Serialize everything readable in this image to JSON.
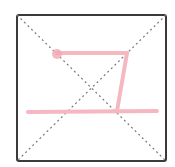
{
  "grid": {
    "box": {
      "x": 17,
      "y": 15,
      "width": 149,
      "height": 146,
      "rx": 2,
      "stroke": "#3a3a3a",
      "stroke_width": 2
    },
    "guide_color": "#7a7a7a",
    "guides": [
      {
        "x1": 17,
        "y1": 15,
        "x2": 166,
        "y2": 161
      },
      {
        "x1": 166,
        "y1": 15,
        "x2": 17,
        "y2": 161
      }
    ]
  },
  "strokes": {
    "color": "#f5b8c0",
    "width": 4,
    "start_dot": {
      "cx": 57,
      "cy": 54,
      "r": 5,
      "color": "#f4a6b2"
    },
    "paths": [
      {
        "name": "top-horizontal-stroke",
        "d": "M 57 53 L 127 53"
      },
      {
        "name": "slanted-vertical-stroke",
        "d": "M 127 53 L 117 111"
      },
      {
        "name": "bottom-horizontal-stroke",
        "d": "M 28 112 L 157 111"
      }
    ]
  }
}
